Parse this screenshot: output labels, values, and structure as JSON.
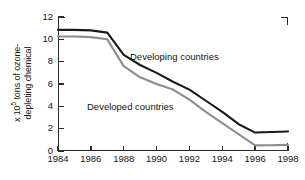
{
  "chart_data": {
    "type": "line",
    "title": "",
    "xlabel": "",
    "ylabel": "x 10^5 tons of ozone-depleting chemical",
    "ylabel_line1": "x 10",
    "ylabel_exponent": "5",
    "ylabel_line1_rest": " tons of ozone-",
    "ylabel_line2": "depleting chemical",
    "xlim": [
      1984,
      1998
    ],
    "ylim": [
      0,
      12
    ],
    "grid": false,
    "legend_position": "inline-annotation",
    "xticks": [
      "1984",
      "1986",
      "1988",
      "1990",
      "1992",
      "1994",
      "1996",
      "1998"
    ],
    "xtick_values": [
      1984,
      1986,
      1988,
      1990,
      1992,
      1994,
      1996,
      1998
    ],
    "yticks": [
      "0",
      "2",
      "4",
      "6",
      "8",
      "10",
      "12"
    ],
    "ytick_values": [
      0,
      2,
      4,
      6,
      8,
      10,
      12
    ],
    "x": [
      1984,
      1985,
      1986,
      1987,
      1988,
      1989,
      1990,
      1991,
      1992,
      1993,
      1994,
      1995,
      1996,
      1997,
      1998
    ],
    "series": [
      {
        "name": "Developing countries",
        "color": "#1a1a1a",
        "values": [
          10.85,
          10.85,
          10.8,
          10.6,
          8.6,
          7.7,
          7.0,
          6.2,
          5.5,
          4.5,
          3.5,
          2.4,
          1.65,
          1.7,
          1.75
        ]
      },
      {
        "name": "Developed countries",
        "color": "#8c8c8c",
        "values": [
          10.25,
          10.25,
          10.2,
          10.0,
          7.6,
          6.6,
          6.0,
          5.5,
          4.6,
          3.5,
          2.5,
          1.5,
          0.5,
          0.52,
          0.55
        ]
      }
    ],
    "annotations": [
      {
        "text": "Developing countries",
        "series": "Developing countries"
      },
      {
        "text": "Developed countries",
        "series": "Developed countries"
      }
    ]
  },
  "axis": {
    "color": "#2b2b2b"
  }
}
